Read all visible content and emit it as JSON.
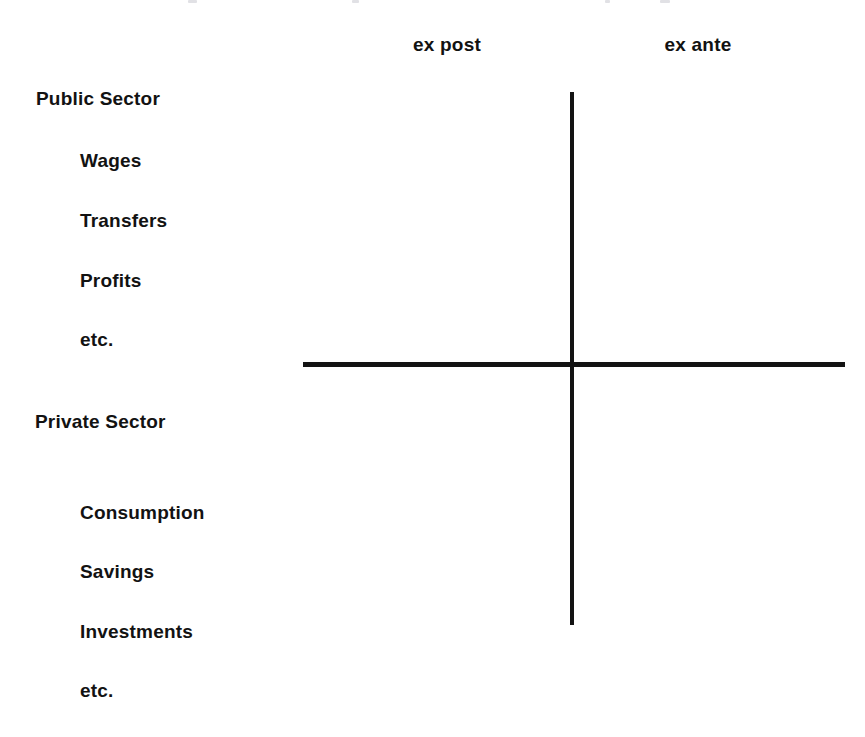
{
  "figure": {
    "type": "diagram",
    "background_color": "#ffffff",
    "ink_color": "#131313"
  },
  "columns": {
    "headers": [
      {
        "label": "ex post",
        "name": "header-ex-post"
      },
      {
        "label": "ex ante",
        "name": "header-ex-ante"
      }
    ]
  },
  "rows": [
    {
      "label": "Public Sector",
      "level": "group",
      "x": 36,
      "y": 89
    },
    {
      "label": "Wages",
      "level": "item",
      "x": 80,
      "y": 151
    },
    {
      "label": "Transfers",
      "level": "item",
      "x": 80,
      "y": 211
    },
    {
      "label": "Profits",
      "level": "item",
      "x": 80,
      "y": 271
    },
    {
      "label": "etc.",
      "level": "item",
      "x": 80,
      "y": 330
    },
    {
      "label": "Private Sector",
      "level": "group",
      "x": 35,
      "y": 412
    },
    {
      "label": "Consumption",
      "level": "item",
      "x": 80,
      "y": 503
    },
    {
      "label": "Savings",
      "level": "item",
      "x": 80,
      "y": 562
    },
    {
      "label": "Investments",
      "level": "item",
      "x": 80,
      "y": 622
    },
    {
      "label": "etc.",
      "level": "item",
      "x": 80,
      "y": 681
    }
  ],
  "axes": {
    "vertical": {
      "x": 570,
      "top": 92,
      "length": 533,
      "thickness": 4
    },
    "horizontal": {
      "y": 362,
      "left": 303,
      "length": 542,
      "thickness": 5
    }
  },
  "artifacts": [
    {
      "x": 188,
      "width": 9
    },
    {
      "x": 352,
      "width": 7
    },
    {
      "x": 605,
      "width": 5
    },
    {
      "x": 660,
      "width": 10
    }
  ]
}
